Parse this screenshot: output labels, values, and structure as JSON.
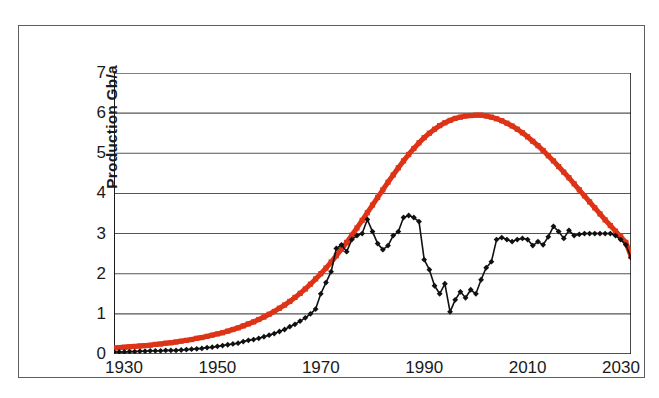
{
  "chart_data": {
    "type": "line",
    "title": "",
    "subtitle": "",
    "xlabel": "",
    "ylabel": "Production Gb/a",
    "xlim": [
      1930,
      2030
    ],
    "ylim": [
      0,
      7
    ],
    "xticks": [
      1930,
      1950,
      1970,
      1990,
      2010,
      2030
    ],
    "xtick_labels": [
      "1930",
      "1950",
      "1970",
      "1990",
      "2010",
      "2030"
    ],
    "yticks": [
      0,
      1,
      2,
      3,
      4,
      5,
      6,
      7
    ],
    "ytick_labels": [
      "0",
      "1",
      "2",
      "3",
      "4",
      "5",
      "6",
      "7"
    ],
    "grid": "horizontal",
    "legend": "none",
    "annotations": [],
    "series": [
      {
        "name": "model-curve",
        "color": "#DD3316",
        "marker": "square",
        "linewidth": 5,
        "x": [
          1930,
          1931,
          1932,
          1933,
          1934,
          1935,
          1936,
          1937,
          1938,
          1939,
          1940,
          1941,
          1942,
          1943,
          1944,
          1945,
          1946,
          1947,
          1948,
          1949,
          1950,
          1951,
          1952,
          1953,
          1954,
          1955,
          1956,
          1957,
          1958,
          1959,
          1960,
          1961,
          1962,
          1963,
          1964,
          1965,
          1966,
          1967,
          1968,
          1969,
          1970,
          1971,
          1972,
          1973,
          1974,
          1975,
          1976,
          1977,
          1978,
          1979,
          1980,
          1981,
          1982,
          1983,
          1984,
          1985,
          1986,
          1987,
          1988,
          1989,
          1990,
          1991,
          1992,
          1993,
          1994,
          1995,
          1996,
          1997,
          1998,
          1999,
          2000,
          2001,
          2002,
          2003,
          2004,
          2005,
          2006,
          2007,
          2008,
          2009,
          2010,
          2011,
          2012,
          2013,
          2014,
          2015,
          2016,
          2017,
          2018,
          2019,
          2020,
          2021,
          2022,
          2023,
          2024,
          2025,
          2026,
          2027,
          2028,
          2029,
          2030
        ],
        "y": [
          0.15,
          0.16,
          0.17,
          0.18,
          0.19,
          0.2,
          0.21,
          0.22,
          0.24,
          0.25,
          0.27,
          0.28,
          0.3,
          0.32,
          0.34,
          0.36,
          0.39,
          0.41,
          0.44,
          0.47,
          0.5,
          0.53,
          0.57,
          0.61,
          0.65,
          0.7,
          0.75,
          0.8,
          0.86,
          0.92,
          0.99,
          1.06,
          1.14,
          1.22,
          1.31,
          1.41,
          1.51,
          1.62,
          1.74,
          1.87,
          2.0,
          2.14,
          2.29,
          2.45,
          2.61,
          2.78,
          2.96,
          3.14,
          3.33,
          3.52,
          3.71,
          3.9,
          4.09,
          4.28,
          4.46,
          4.64,
          4.81,
          4.97,
          5.12,
          5.26,
          5.39,
          5.5,
          5.6,
          5.69,
          5.76,
          5.82,
          5.87,
          5.9,
          5.93,
          5.94,
          5.95,
          5.95,
          5.93,
          5.9,
          5.86,
          5.81,
          5.75,
          5.68,
          5.6,
          5.51,
          5.41,
          5.3,
          5.19,
          5.07,
          4.94,
          4.81,
          4.67,
          4.53,
          4.39,
          4.24,
          4.09,
          3.94,
          3.79,
          3.64,
          3.49,
          3.34,
          3.2,
          3.06,
          2.92,
          2.78,
          2.44
        ]
      },
      {
        "name": "historic-production",
        "color": "#111111",
        "marker": "diamond",
        "linewidth": 1.6,
        "x": [
          1930,
          1931,
          1932,
          1933,
          1934,
          1935,
          1936,
          1937,
          1938,
          1939,
          1940,
          1941,
          1942,
          1943,
          1944,
          1945,
          1946,
          1947,
          1948,
          1949,
          1950,
          1951,
          1952,
          1953,
          1954,
          1955,
          1956,
          1957,
          1958,
          1959,
          1960,
          1961,
          1962,
          1963,
          1964,
          1965,
          1966,
          1967,
          1968,
          1969,
          1970,
          1971,
          1972,
          1973,
          1974,
          1975,
          1976,
          1977,
          1978,
          1979,
          1980,
          1981,
          1982,
          1983,
          1984,
          1985,
          1986,
          1987,
          1988,
          1989,
          1990,
          1991,
          1992,
          1993,
          1994,
          1995,
          1996,
          1997,
          1998,
          1999,
          2000,
          2001,
          2002,
          2003,
          2004,
          2005,
          2006,
          2007,
          2008,
          2009,
          2010,
          2011,
          2012,
          2013,
          2014,
          2015,
          2016,
          2017,
          2018,
          2019,
          2020,
          2021,
          2022,
          2023,
          2024,
          2025,
          2026,
          2027,
          2028,
          2029,
          2030
        ],
        "y": [
          0.05,
          0.05,
          0.05,
          0.06,
          0.06,
          0.07,
          0.07,
          0.08,
          0.08,
          0.08,
          0.09,
          0.09,
          0.09,
          0.1,
          0.11,
          0.12,
          0.13,
          0.14,
          0.16,
          0.17,
          0.19,
          0.21,
          0.23,
          0.25,
          0.27,
          0.31,
          0.34,
          0.36,
          0.39,
          0.43,
          0.47,
          0.51,
          0.56,
          0.61,
          0.68,
          0.74,
          0.82,
          0.9,
          1.0,
          1.12,
          1.5,
          1.78,
          2.05,
          2.63,
          2.72,
          2.55,
          2.85,
          2.95,
          3.0,
          3.35,
          3.05,
          2.75,
          2.6,
          2.7,
          2.95,
          3.05,
          3.4,
          3.45,
          3.4,
          3.3,
          2.35,
          2.1,
          1.7,
          1.5,
          1.75,
          1.05,
          1.35,
          1.55,
          1.4,
          1.6,
          1.5,
          1.85,
          2.15,
          2.3,
          2.85,
          2.9,
          2.85,
          2.8,
          2.85,
          2.88,
          2.85,
          2.7,
          2.8,
          2.72,
          2.92,
          3.18,
          3.05,
          2.88,
          3.08,
          2.95,
          2.98,
          3.0,
          3.0,
          3.0,
          3.0,
          3.0,
          3.0,
          2.95,
          2.85,
          2.72,
          2.4
        ]
      }
    ]
  }
}
